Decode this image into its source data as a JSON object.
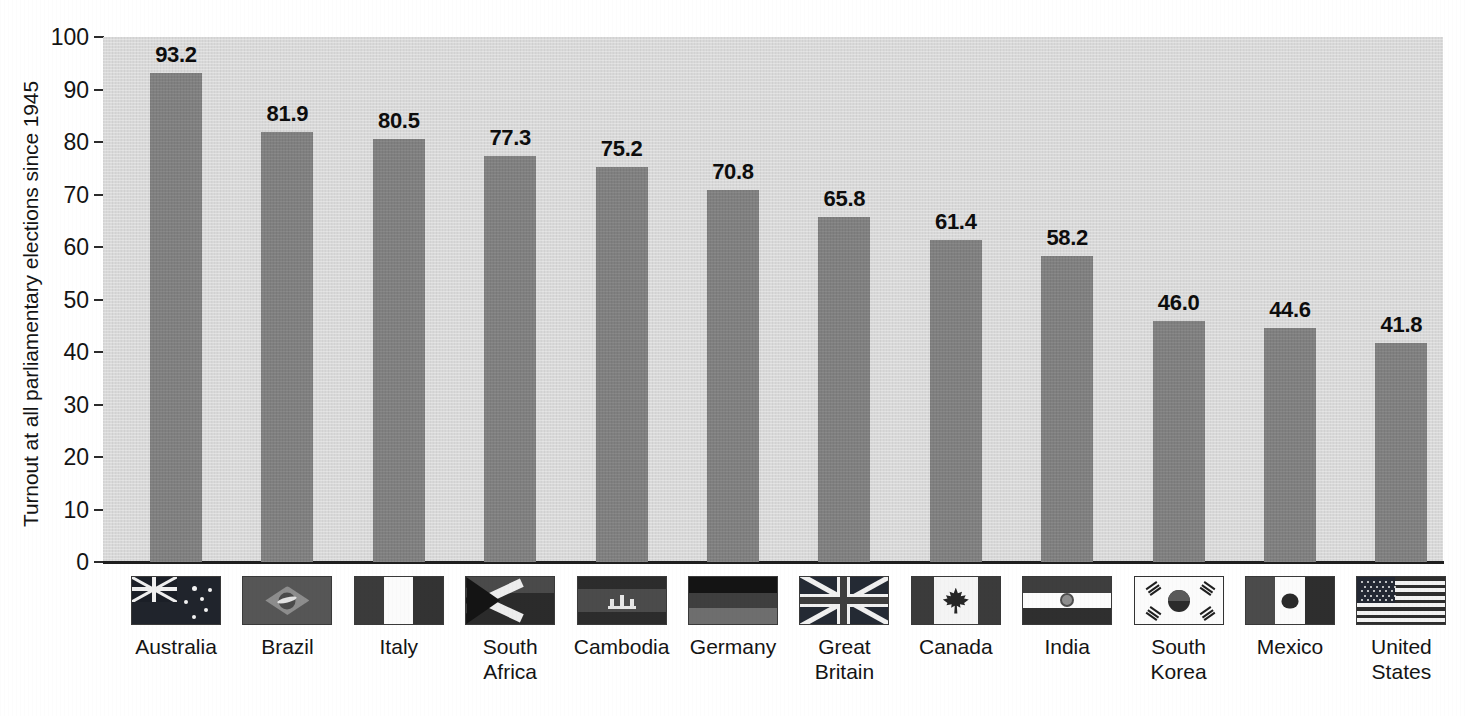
{
  "chart_data": {
    "type": "bar",
    "title": "",
    "xlabel": "",
    "ylabel": "Turnout at all parliamentary elections since 1945",
    "ylim": [
      0,
      100
    ],
    "ytick_labels": [
      "100",
      "90",
      "80",
      "70",
      "60",
      "50",
      "40",
      "30",
      "20",
      "10",
      "0"
    ],
    "yticks": [
      100,
      90,
      80,
      70,
      60,
      50,
      40,
      30,
      20,
      10,
      0
    ],
    "grid": false,
    "legend": "none",
    "categories": [
      "Australia",
      "Brazil",
      "Italy",
      "South Africa",
      "Cambodia",
      "Germany",
      "Great Britain",
      "Canada",
      "India",
      "South Korea",
      "Mexico",
      "United States"
    ],
    "values": [
      93.2,
      81.9,
      80.5,
      77.3,
      75.2,
      70.8,
      65.8,
      61.4,
      58.2,
      46.0,
      44.6,
      41.8
    ],
    "value_labels": [
      "93.2",
      "81.9",
      "80.5",
      "77.3",
      "75.2",
      "70.8",
      "65.8",
      "61.4",
      "58.2",
      "46.0",
      "44.6",
      "41.8"
    ]
  },
  "axis": {
    "y_title": "Turnout at all parliamentary elections since 1945"
  },
  "categories": [
    {
      "label_line1": "Australia",
      "label_line2": "",
      "flag_icon": "flag-australia-icon"
    },
    {
      "label_line1": "Brazil",
      "label_line2": "",
      "flag_icon": "flag-brazil-icon"
    },
    {
      "label_line1": "Italy",
      "label_line2": "",
      "flag_icon": "flag-italy-icon"
    },
    {
      "label_line1": "South",
      "label_line2": "Africa",
      "flag_icon": "flag-south-africa-icon"
    },
    {
      "label_line1": "Cambodia",
      "label_line2": "",
      "flag_icon": "flag-cambodia-icon"
    },
    {
      "label_line1": "Germany",
      "label_line2": "",
      "flag_icon": "flag-germany-icon"
    },
    {
      "label_line1": "Great",
      "label_line2": "Britain",
      "flag_icon": "flag-great-britain-icon"
    },
    {
      "label_line1": "Canada",
      "label_line2": "",
      "flag_icon": "flag-canada-icon"
    },
    {
      "label_line1": "India",
      "label_line2": "",
      "flag_icon": "flag-india-icon"
    },
    {
      "label_line1": "South",
      "label_line2": "Korea",
      "flag_icon": "flag-south-korea-icon"
    },
    {
      "label_line1": "Mexico",
      "label_line2": "",
      "flag_icon": "flag-mexico-icon"
    },
    {
      "label_line1": "United",
      "label_line2": "States",
      "flag_icon": "flag-united-states-icon"
    }
  ],
  "colors": {
    "bar_fill": "#808080",
    "plot_background": "#d9d9d9",
    "page_background": "#ffffff",
    "axis_line": "#1f1f1f",
    "text": "#141414"
  }
}
